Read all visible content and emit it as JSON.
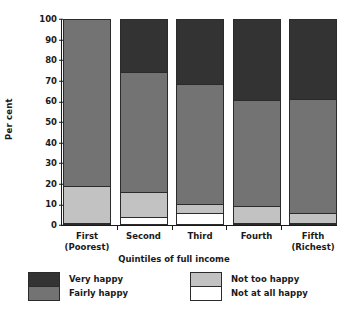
{
  "chart_data": {
    "type": "bar",
    "subtype": "stacked-100",
    "title": "",
    "xlabel": "Quintiles of full income",
    "ylabel": "Per cent",
    "ylim": [
      0,
      100
    ],
    "yticks": [
      0,
      10,
      20,
      30,
      40,
      50,
      60,
      70,
      80,
      90,
      100
    ],
    "ytick_labels": [
      "0",
      "10",
      "20",
      "30",
      "40",
      "50",
      "60",
      "70",
      "80",
      "90",
      "100"
    ],
    "grid": false,
    "legend_position": "bottom",
    "categories": [
      "First (Poorest)",
      "Second",
      "Third",
      "Fourth",
      "Fifth (Richest)"
    ],
    "category_lines": [
      [
        "First",
        "(Poorest)"
      ],
      [
        "Second",
        ""
      ],
      [
        "Third",
        ""
      ],
      [
        "Fourth",
        ""
      ],
      [
        "Fifth",
        "(Richest)"
      ]
    ],
    "stack_order_bottom_to_top": [
      "Not at all happy",
      "Not too happy",
      "Fairly happy",
      "Very happy"
    ],
    "series": [
      {
        "name": "Not at all happy",
        "color": "#ffffff",
        "values": [
          0,
          3,
          5,
          0,
          0
        ]
      },
      {
        "name": "Not too happy",
        "color": "#c2c2c2",
        "values": [
          18,
          12,
          4.5,
          8.5,
          5
        ]
      },
      {
        "name": "Fairly happy",
        "color": "#737373",
        "values": [
          82,
          59,
          58.5,
          52,
          56
        ]
      },
      {
        "name": "Very happy",
        "color": "#333333",
        "values": [
          0,
          26,
          32,
          39.5,
          39
        ]
      }
    ],
    "cumulative_tops": [
      {
        "category": "First (Poorest)",
        "not_at_all": 0,
        "not_too": 18,
        "fairly": 100,
        "very": 100
      },
      {
        "category": "Second",
        "not_at_all": 3,
        "not_too": 15,
        "fairly": 74,
        "very": 100
      },
      {
        "category": "Third",
        "not_at_all": 5,
        "not_too": 9.5,
        "fairly": 68,
        "very": 100
      },
      {
        "category": "Fourth",
        "not_at_all": 0,
        "not_too": 8.5,
        "fairly": 60.5,
        "very": 100
      },
      {
        "category": "Fifth (Richest)",
        "not_at_all": 0,
        "not_too": 5,
        "fairly": 61,
        "very": 100
      }
    ]
  },
  "legend": {
    "left_items": [
      {
        "label": "Very happy",
        "swatch": "very"
      },
      {
        "label": "Fairly happy",
        "swatch": "fairly"
      }
    ],
    "right_items": [
      {
        "label": "Not too happy",
        "swatch": "nottoo"
      },
      {
        "label": "Not at all happy",
        "swatch": "notatall"
      }
    ]
  },
  "colors": {
    "very_happy": "#333333",
    "fairly_happy": "#737373",
    "not_too_happy": "#c2c2c2",
    "not_at_all_happy": "#ffffff",
    "axis": "#1a1a1a",
    "background": "#ffffff"
  }
}
